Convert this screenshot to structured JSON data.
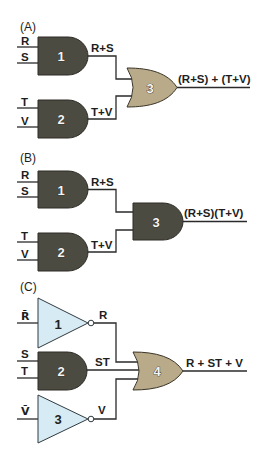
{
  "colors": {
    "and_gate_fill": "#4c4b41",
    "or_gate_fill": "#b9aa8a",
    "not_gate_fill": "#d7ebf4",
    "wire": "#2a2a2a",
    "text": "#1e1e1e"
  },
  "panels": [
    {
      "label": "(A)",
      "inputs": [
        "R",
        "S",
        "T",
        "V"
      ],
      "gates": [
        {
          "number": "1",
          "type": "AND"
        },
        {
          "number": "2",
          "type": "AND"
        },
        {
          "number": "3",
          "type": "OR"
        }
      ],
      "intermediate_outputs": [
        "R+S",
        "T+V"
      ],
      "output": "(R+S) + (T+V)"
    },
    {
      "label": "(B)",
      "inputs": [
        "R",
        "S",
        "T",
        "V"
      ],
      "gates": [
        {
          "number": "1",
          "type": "AND"
        },
        {
          "number": "2",
          "type": "AND"
        },
        {
          "number": "3",
          "type": "AND"
        }
      ],
      "intermediate_outputs": [
        "R+S",
        "T+V"
      ],
      "output": "(R+S)(T+V)"
    },
    {
      "label": "(C)",
      "inputs": [
        "R̄",
        "S",
        "T",
        "V̄"
      ],
      "gates": [
        {
          "number": "1",
          "type": "NOT"
        },
        {
          "number": "2",
          "type": "AND"
        },
        {
          "number": "3",
          "type": "NOT"
        },
        {
          "number": "4",
          "type": "OR"
        }
      ],
      "intermediate_outputs": [
        "R",
        "ST",
        "V"
      ],
      "output": "R + ST + V"
    }
  ]
}
